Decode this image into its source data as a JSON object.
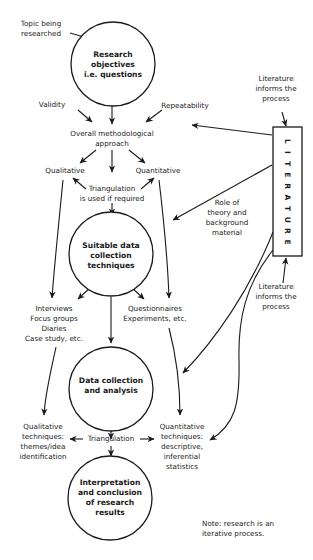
{
  "diagram": {
    "nodes": {
      "topic": {
        "lines": [
          "Topic being",
          "researched"
        ]
      },
      "objectives": {
        "lines": [
          "Research",
          "objectives",
          "i.e. questions"
        ]
      },
      "validity": {
        "lines": [
          "Validity"
        ]
      },
      "repeatability": {
        "lines": [
          "Repeatability"
        ]
      },
      "approach": {
        "lines": [
          "Overall methodological",
          "approach"
        ]
      },
      "qualitative": {
        "lines": [
          "Qualitative"
        ]
      },
      "quantitative": {
        "lines": [
          "Quantitative"
        ]
      },
      "triangulation_1": {
        "lines": [
          "Triangulation",
          "is used if required"
        ]
      },
      "suitable": {
        "lines": [
          "Suitable data",
          "collection",
          "techniques"
        ]
      },
      "qual_methods": {
        "lines": [
          "Interviews",
          "Focus groups",
          "Diaries",
          "Case study, etc."
        ]
      },
      "quant_methods": {
        "lines": [
          "Questionnaires",
          "Experiments, etc."
        ]
      },
      "analysis": {
        "lines": [
          "Data collection",
          "and analysis"
        ]
      },
      "qual_techniques": {
        "lines": [
          "Qualitative",
          "techniques:",
          "themes/idea",
          "identification"
        ]
      },
      "triangulation_2": {
        "lines": [
          "Triangulation"
        ]
      },
      "quant_techniques": {
        "lines": [
          "Quantitative",
          "techniques:",
          "descriptive,",
          "inferential",
          "statistics"
        ]
      },
      "interpretation": {
        "lines": [
          "Interpretation",
          "and conclusion",
          "of research",
          "results"
        ]
      },
      "literature": {
        "label": "LITERATURE"
      },
      "lit_informs_top": {
        "lines": [
          "Literature",
          "informs the",
          "process"
        ]
      },
      "role_theory": {
        "lines": [
          "Role of",
          "theory and",
          "background",
          "material"
        ]
      },
      "lit_informs_bottom": {
        "lines": [
          "Literature",
          "informs the",
          "process"
        ]
      },
      "note": {
        "lines": [
          "Note: research is an",
          "iterative process."
        ]
      }
    }
  }
}
